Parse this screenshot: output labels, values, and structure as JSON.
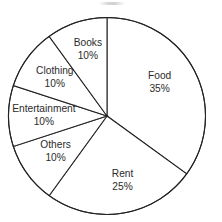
{
  "chart_data": {
    "type": "pie",
    "title": "",
    "subtitle": "",
    "xlabel": "",
    "ylabel": "",
    "legend_position": "none",
    "grid": false,
    "label_format": "name_over_percent",
    "unit": "%",
    "start_angle_deg": 0,
    "direction": "clockwise",
    "categories": [
      "Food",
      "Rent",
      "Others",
      "Entertainment",
      "Clothing",
      "Books"
    ],
    "values": [
      35,
      25,
      10,
      10,
      10,
      10
    ],
    "slices": [
      {
        "name": "Food",
        "value": 35,
        "value_label": "35%",
        "label_radius_factor": 0.6,
        "label_dx": 0,
        "label_dy": -6
      },
      {
        "name": "Rent",
        "value": 25,
        "value_label": "25%",
        "label_radius_factor": 0.62,
        "label_dx": 6,
        "label_dy": 4
      },
      {
        "name": "Others",
        "value": 10,
        "value_label": "10%",
        "label_radius_factor": 0.62,
        "label_dx": -2,
        "label_dy": 0
      },
      {
        "name": "Entertainment",
        "value": 10,
        "value_label": "10%",
        "label_radius_factor": 0.6,
        "label_dx": -4,
        "label_dy": 0
      },
      {
        "name": "Clothing",
        "value": 10,
        "value_label": "10%",
        "label_radius_factor": 0.63,
        "label_dx": -2,
        "label_dy": -2
      },
      {
        "name": "Books",
        "value": 10,
        "value_label": "10%",
        "label_radius_factor": 0.66,
        "label_dx": 1,
        "label_dy": -4
      }
    ],
    "geometry": {
      "center_x": 107,
      "center_y": 116,
      "radius": 98.5
    },
    "style": {
      "slice_fill": "#ffffff",
      "outline_color": "#232323",
      "outline_width": 1.05,
      "label_color": "#2b2b2b",
      "background": "#ffffff"
    }
  }
}
